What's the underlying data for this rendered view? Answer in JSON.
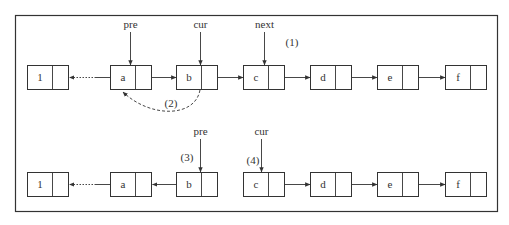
{
  "diagram": {
    "top_row": {
      "nodes": [
        {
          "label": "1",
          "x": 27
        },
        {
          "label": "a",
          "x": 110
        },
        {
          "label": "b",
          "x": 176
        },
        {
          "label": "c",
          "x": 243
        },
        {
          "label": "d",
          "x": 310
        },
        {
          "label": "e",
          "x": 377
        },
        {
          "label": "f",
          "x": 445
        }
      ],
      "pointers": [
        {
          "name": "pre",
          "x": 130
        },
        {
          "name": "cur",
          "x": 200
        },
        {
          "name": "next",
          "x": 264
        }
      ],
      "step_labels": [
        {
          "text": "(1)",
          "x": 292,
          "y": 46
        },
        {
          "text": "(2)",
          "x": 171,
          "y": 107
        }
      ]
    },
    "bottom_row": {
      "nodes": [
        {
          "label": "1",
          "x": 27
        },
        {
          "label": "a",
          "x": 110
        },
        {
          "label": "b",
          "x": 176
        },
        {
          "label": "c",
          "x": 243
        },
        {
          "label": "d",
          "x": 310
        },
        {
          "label": "e",
          "x": 377
        },
        {
          "label": "f",
          "x": 445
        }
      ],
      "pointers": [
        {
          "name": "pre",
          "x": 200
        },
        {
          "name": "cur",
          "x": 261
        }
      ],
      "step_labels": [
        {
          "text": "(3)",
          "x": 187,
          "y": 161
        },
        {
          "text": "(4)",
          "x": 253,
          "y": 164
        }
      ]
    },
    "colors": {
      "stroke": "#333333",
      "background": "#ffffff"
    }
  }
}
